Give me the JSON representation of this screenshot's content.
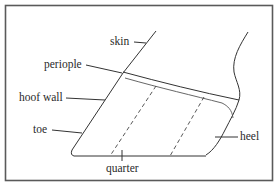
{
  "diagram": {
    "labels": {
      "skin": "skin",
      "periople": "periople",
      "hoof_wall": "hoof wall",
      "toe": "toe",
      "quarter": "quarter",
      "heel": "heel"
    },
    "colors": {
      "line": "#333333",
      "frame": "#555555",
      "background": "#ffffff"
    }
  }
}
